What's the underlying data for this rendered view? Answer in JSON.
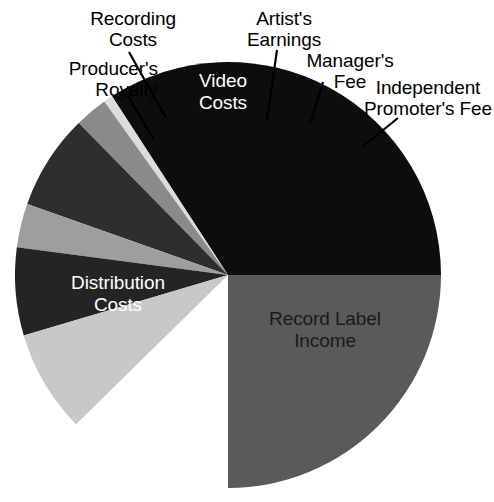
{
  "chart": {
    "type": "pie",
    "title": "",
    "background_color": "#ffffff",
    "center": {
      "x": 228,
      "y": 275
    },
    "radius": 213
  },
  "chart_data": {
    "type": "pie",
    "title": "",
    "subtitle": "",
    "xlabel": "",
    "ylabel": "",
    "legend_position": "none",
    "grid": false,
    "labels_shown_as": "callout labels with leader lines and in-slice labels",
    "categories": [
      "Record Label Income",
      "Distribution Costs",
      "Producer's Royalty",
      "Recording Costs",
      "Video Costs",
      "Artist's Earnings",
      "Manager's Fee",
      "Independent Promoter's Fee"
    ],
    "values": [
      25.0,
      34.2,
      0.7,
      2.5,
      7.2,
      3.3,
      6.7,
      7.8
    ],
    "units": "percent of total",
    "slices": [
      {
        "name": "Record Label Income",
        "label": "Record Label\nIncome",
        "value": 25.0,
        "color": "#5a5a5a",
        "start_angle": 0,
        "end_angle": 90,
        "label_placement": "inside",
        "label_color": "#1a1a1a"
      },
      {
        "name": "Distribution Costs",
        "label": "Distribution\nCosts",
        "value": 34.2,
        "color": "#0d0d0d",
        "start_angle": 90,
        "end_angle": 213,
        "label_placement": "inside",
        "label_color": "#ffffff"
      },
      {
        "name": "Producer's Royalty",
        "label": "Producer's\nRoyalty",
        "value": 0.7,
        "color": "#dcdcdc",
        "start_angle": 213,
        "end_angle": 215.5,
        "label_placement": "outside",
        "label_color": "#000000"
      },
      {
        "name": "Recording Costs",
        "label": "Recording\nCosts",
        "value": 2.5,
        "color": "#8a8a8a",
        "start_angle": 215.5,
        "end_angle": 224.5,
        "label_placement": "outside",
        "label_color": "#000000"
      },
      {
        "name": "Video Costs",
        "label": "Video\nCosts",
        "value": 7.2,
        "color": "#2e2e2e",
        "start_angle": 224.5,
        "end_angle": 250.5,
        "label_placement": "inside",
        "label_color": "#ffffff"
      },
      {
        "name": "Artist's Earnings",
        "label": "Artist's\nEarnings",
        "value": 3.3,
        "color": "#9e9e9e",
        "start_angle": 250.5,
        "end_angle": 262.5,
        "label_placement": "outside",
        "label_color": "#000000"
      },
      {
        "name": "Manager's Fee",
        "label": "Manager's\nFee",
        "value": 6.7,
        "color": "#242424",
        "start_angle": 262.5,
        "end_angle": 286.5,
        "label_placement": "outside",
        "label_color": "#000000"
      },
      {
        "name": "Independent Promoter's Fee",
        "label": "Independent\nPromoter's Fee",
        "value": 7.8,
        "color": "#c8c8c8",
        "start_angle": 286.5,
        "end_angle": 314.5,
        "label_placement": "outside",
        "label_color": "#000000"
      }
    ]
  },
  "labels": {
    "producers_royalty": "Producer's\nRoyalty",
    "recording_costs": "Recording\nCosts",
    "video_costs": "Video\nCosts",
    "artists_earnings": "Artist's\nEarnings",
    "managers_fee": "Manager's\nFee",
    "independent_promoters_fee": "Independent\nPromoter's Fee",
    "distribution_costs": "Distribution\nCosts",
    "record_label_income": "Record Label\nIncome"
  },
  "colors": {
    "record_label_income": "#5a5a5a",
    "distribution_costs": "#0d0d0d",
    "producers_royalty": "#dcdcdc",
    "recording_costs": "#8a8a8a",
    "video_costs": "#2e2e2e",
    "artists_earnings": "#9e9e9e",
    "managers_fee": "#242424",
    "independent_promoters_fee": "#c8c8c8",
    "leader_line": "#000000",
    "background": "#ffffff",
    "label_light": "#ffffff",
    "label_dark": "#1a1a1a"
  }
}
